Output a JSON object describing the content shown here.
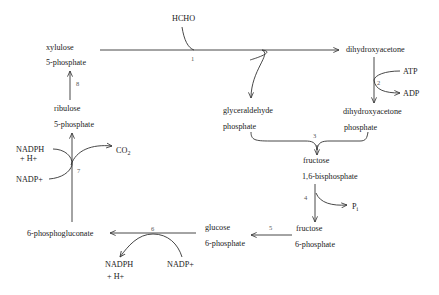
{
  "diagram": {
    "nodes": {
      "hcho": "HCHO",
      "xylulose_1": "xylulose",
      "xylulose_2": "5-phosphate",
      "dha": "dihydroxyacetone",
      "atp": "ATP",
      "adp": "ADP",
      "dhap_1": "dihydroxyacetone",
      "dhap_2": "phosphate",
      "ribulose_1": "ribulose",
      "ribulose_2": "5-phosphate",
      "gap_1": "glyceraldehyde",
      "gap_2": "phosphate",
      "fbp_1": "fructose",
      "fbp_2": "1,6-bisphosphate",
      "pi": "P",
      "pi_sub": "i",
      "nadph_7a": "NADPH",
      "nadph_7b": "+ H+",
      "co2": "CO",
      "co2_sub": "2",
      "nadp_7": "NADP+",
      "f6p_1": "fructose",
      "f6p_2": "6-phosphate",
      "g6p_1": "glucose",
      "g6p_2": "6-phosphate",
      "pgluconate": "6-phosphogluconate",
      "nadph_6a": "NADPH",
      "nadph_6b": "+ H+",
      "nadp_6": "NADP+"
    },
    "steps": {
      "s1": "1",
      "s2": "2",
      "s3": "3",
      "s4": "4",
      "s5": "5",
      "s6": "6",
      "s7": "7",
      "s8": "8"
    }
  }
}
